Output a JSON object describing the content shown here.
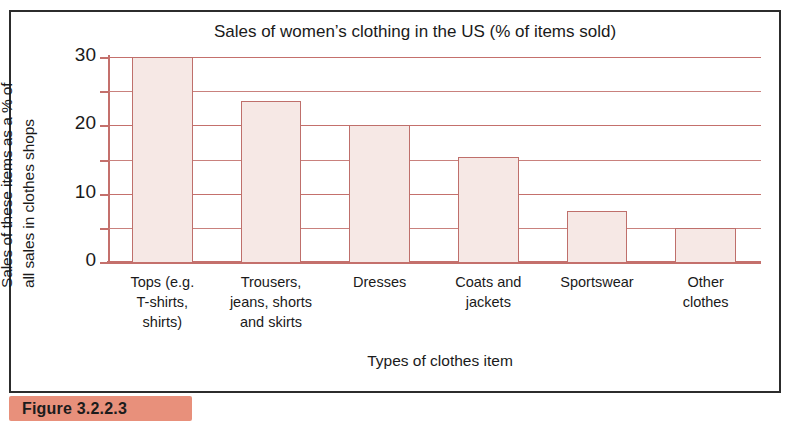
{
  "figure": {
    "caption": "Figure 3.2.2.3",
    "banner_color": "#e8907b",
    "frame_color": "#2c2c2c"
  },
  "chart_data": {
    "type": "bar",
    "title": "Sales of women’s clothing in the US (% of items sold)",
    "xlabel": "Types of clothes item",
    "ylabel": "Sales of these items as a % of all sales in clothes shops",
    "ylabel_lines": [
      "Sales of these items as a % of",
      "all sales in clothes shops"
    ],
    "categories": [
      "Tops (e.g. T-shirts, shirts)",
      "Trousers, jeans, shorts and skirts",
      "Dresses",
      "Coats and jackets",
      "Sportswear",
      "Other clothes"
    ],
    "category_label_lines": [
      [
        "Tops (e.g.",
        "T-shirts,",
        "shirts)"
      ],
      [
        "Trousers,",
        "jeans, shorts",
        "and skirts"
      ],
      [
        "Dresses"
      ],
      [
        "Coats and",
        "jackets"
      ],
      [
        "Sportswear"
      ],
      [
        "Other",
        "clothes"
      ]
    ],
    "values": [
      30,
      23.5,
      20,
      15.3,
      7.5,
      5
    ],
    "ylim": [
      0,
      30
    ],
    "yticks": [
      0,
      10,
      20,
      30
    ],
    "ytick_labels": [
      "0",
      "10",
      "20",
      "30"
    ],
    "minor_gridlines": [
      5,
      15,
      25
    ],
    "grid": true,
    "legend": null,
    "bar_fill_color": "#f6e8e5",
    "bar_border_color": "#bf6f6b",
    "gridline_color": "#c9817d",
    "axis_color": "#c4706c"
  }
}
